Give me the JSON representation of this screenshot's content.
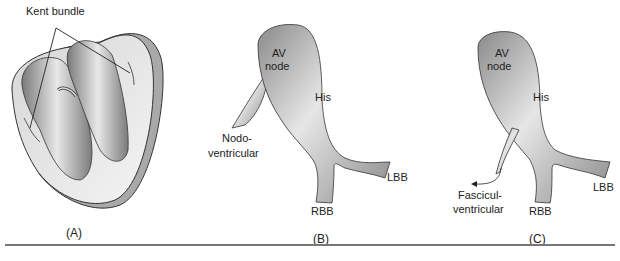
{
  "figure": {
    "panels": [
      {
        "id": "A",
        "label": "(A)",
        "annotations": [
          "Kent bundle"
        ]
      },
      {
        "id": "B",
        "label": "(B)",
        "annotations": [
          "AV node",
          "His",
          "Nodo-ventricular",
          "RBB",
          "LBB"
        ]
      },
      {
        "id": "C",
        "label": "(C)",
        "annotations": [
          "AV node",
          "His",
          "Fascicul-ventricular",
          "RBB",
          "LBB"
        ]
      }
    ],
    "text": {
      "kent": "Kent bundle",
      "av": "AV",
      "node": "node",
      "his": "His",
      "nodo1": "Nodo-",
      "nodo2": "ventricular",
      "fasc1": "Fascicul-",
      "fasc2": "ventricular",
      "rbb": "RBB",
      "lbb": "LBB",
      "labelA": "(A)",
      "labelB": "(B)",
      "labelC": "(C)"
    },
    "colors": {
      "tissue_dark": "#7a7a7a",
      "tissue_light": "#e8e8e8",
      "outline": "#333333",
      "rule": "#777777"
    }
  }
}
